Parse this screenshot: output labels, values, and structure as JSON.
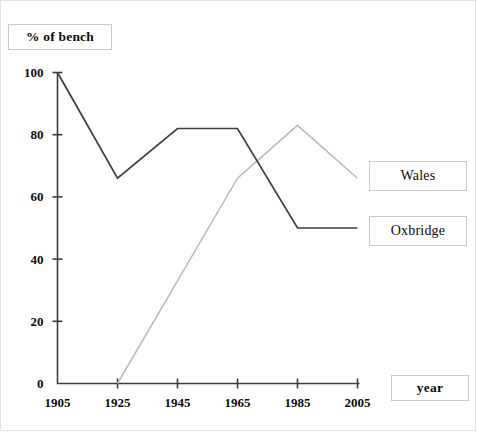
{
  "chart_data": {
    "type": "line",
    "title": "% of bench",
    "xlabel": "year",
    "ylabel": "% of bench",
    "categories": [
      1905,
      1925,
      1945,
      1965,
      1985,
      2005
    ],
    "x_tick_labels": [
      "1905",
      "1925",
      "1945",
      "1965",
      "1985",
      "2005"
    ],
    "y_tick_labels": [
      "0",
      "20",
      "40",
      "60",
      "80",
      "100"
    ],
    "y_ticks": [
      0,
      20,
      40,
      60,
      80,
      100
    ],
    "xlim": [
      1905,
      2005
    ],
    "ylim": [
      0,
      100
    ],
    "grid": false,
    "legend_position": "right",
    "series": [
      {
        "name": "Oxbridge",
        "color": "#3d3d3d",
        "x": [
          1905,
          1925,
          1945,
          1965,
          1985,
          2005
        ],
        "values": [
          100,
          66,
          82,
          82,
          50,
          50
        ]
      },
      {
        "name": "Wales",
        "color": "#b9b9b9",
        "x": [
          1925,
          1945,
          1965,
          1985,
          2005
        ],
        "values": [
          0,
          33,
          66,
          83,
          66
        ]
      }
    ]
  },
  "labels": {
    "title_text": "% of bench",
    "xaxis_title_text": "year",
    "legend_wales": "Wales",
    "legend_oxbridge": "Oxbridge"
  },
  "colors": {
    "oxbridge_line": "#3d3d3d",
    "wales_line": "#b9b9b9",
    "axis": "#3d3d3d",
    "text": "#0b0b0b",
    "box_border": "#c9c9c9",
    "background": "#ffffff"
  }
}
